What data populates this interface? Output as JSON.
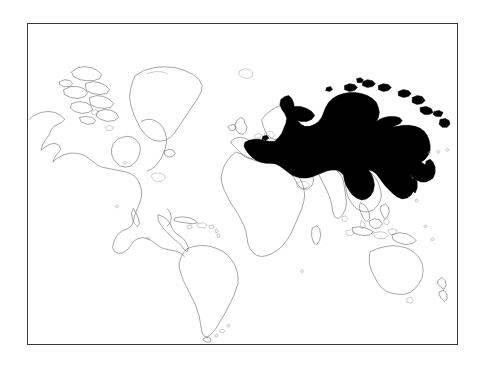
{
  "figure": {
    "kind": "locator-map",
    "title": "World map with Russia highlighted",
    "frame": {
      "border_color": "#3a3a3a",
      "background_color": "#ffffff",
      "x": 27,
      "y": 23,
      "width": 431,
      "height": 322
    },
    "style": {
      "outline_color": "#5b5b5b",
      "faint_outline_color": "#8e8e8e",
      "highlight_fill": "#000000",
      "page_background": "#ffffff"
    },
    "labels": [],
    "legend": {
      "present": false,
      "entries": []
    }
  },
  "chart_data": {
    "type": "map",
    "title": "",
    "subtitle": "",
    "xlabel": "",
    "ylabel": "",
    "projection": "equirectangular",
    "graticule": false,
    "grid": false,
    "legend_position": "none",
    "highlighted_regions": [
      {
        "name": "Russia",
        "fill": "#000000",
        "value": 1
      }
    ],
    "outlined_regions": [
      "North America",
      "Greenland",
      "Canadian Arctic Archipelago",
      "Alaska",
      "Central America",
      "Caribbean",
      "South America",
      "Iceland",
      "British Isles",
      "Scandinavia",
      "Europe",
      "Africa",
      "Madagascar",
      "Arabian Peninsula",
      "Middle East",
      "India",
      "Sri Lanka",
      "China",
      "Mongolia",
      "Korea",
      "Japan",
      "Southeast Asia",
      "Indonesia",
      "Philippines",
      "New Guinea",
      "Australia",
      "Tasmania",
      "New Zealand"
    ]
  }
}
